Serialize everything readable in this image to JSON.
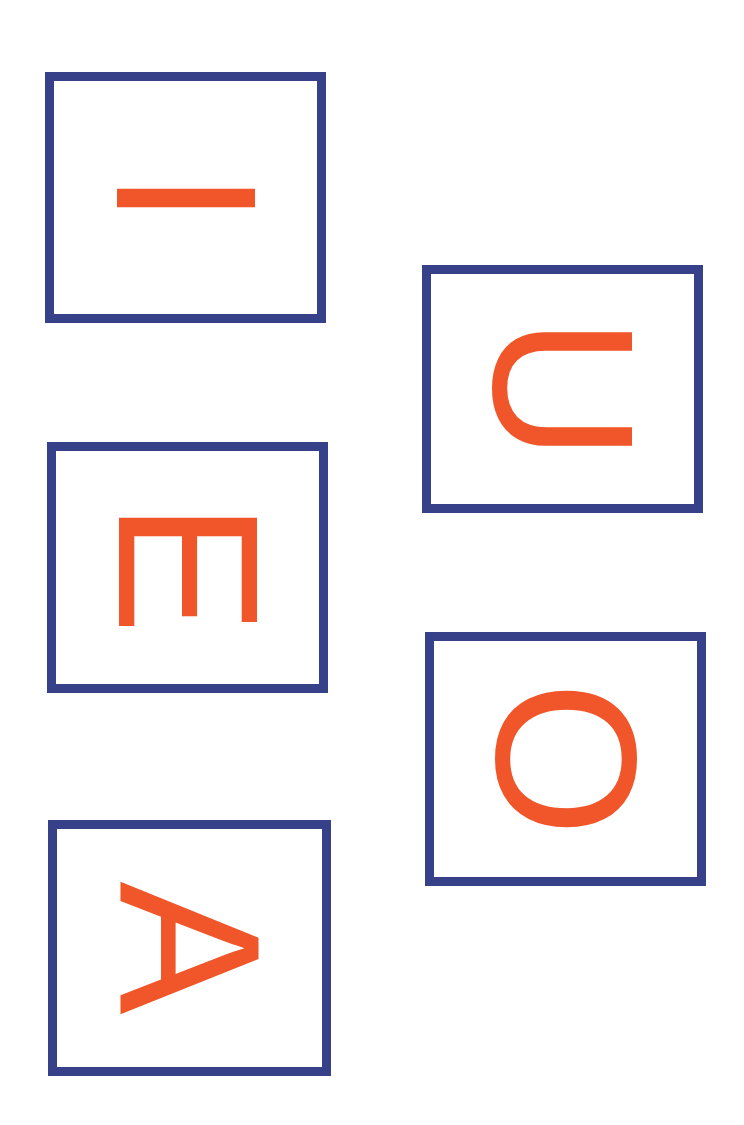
{
  "cards": [
    {
      "letter": "I",
      "x": 45,
      "y": 72,
      "w": 281,
      "h": 251
    },
    {
      "letter": "E",
      "x": 47,
      "y": 442,
      "w": 281,
      "h": 251
    },
    {
      "letter": "A",
      "x": 48,
      "y": 820,
      "w": 283,
      "h": 256
    },
    {
      "letter": "U",
      "x": 422,
      "y": 265,
      "w": 281,
      "h": 248
    },
    {
      "letter": "O",
      "x": 425,
      "y": 632,
      "w": 281,
      "h": 254
    }
  ],
  "colors": {
    "border": "#37418a",
    "letter": "#f0562a"
  }
}
